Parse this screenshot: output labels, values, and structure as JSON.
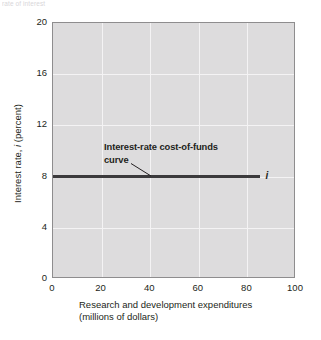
{
  "top_caption": "rate of interest",
  "chart_data": {
    "type": "line",
    "title": "",
    "subtitle": "",
    "xlabel_line1": "Research and development expenditures",
    "xlabel_line2": "(millions of dollars)",
    "ylabel_prefix": "Interest rate, ",
    "ylabel_symbol": "i",
    "ylabel_suffix": " (percent)",
    "xlim": [
      0,
      100
    ],
    "ylim": [
      0,
      20
    ],
    "xticks": [
      0,
      20,
      40,
      60,
      80,
      100
    ],
    "xtick_labels": [
      "0",
      "20",
      "40",
      "60",
      "80",
      "100"
    ],
    "yticks": [
      0,
      4,
      8,
      12,
      16,
      20
    ],
    "ytick_labels": [
      "0",
      "4",
      "8",
      "12",
      "16",
      "20"
    ],
    "grid": true,
    "grid_color": "#f4f3f4",
    "plot_bg_color": "#dddcdd",
    "plot_border_color": "#8e8d8e",
    "legend": "none",
    "series": [
      {
        "name": "Interest-rate cost-of-funds curve",
        "symbol": "i",
        "color": "#3b3a3c",
        "style": "horizontal-line",
        "x": [
          0,
          85
        ],
        "y": [
          8,
          8
        ],
        "constant_value": 8
      }
    ],
    "annotations": [
      {
        "id": "curve-label",
        "line1": "Interest-rate cost-of-funds",
        "line2": "curve",
        "bold": true,
        "leader_to_x": 37,
        "leader_to_y": 8
      },
      {
        "id": "curve-endpoint",
        "text": "i",
        "italic": true,
        "at_x": 87,
        "at_y": 8
      }
    ]
  }
}
